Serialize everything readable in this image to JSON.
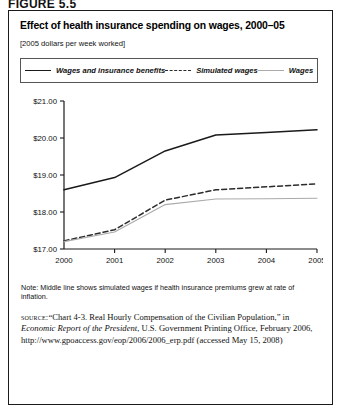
{
  "figure_label": "FIGURE 5.5",
  "chart_data": {
    "type": "line",
    "title": "Effect of health insurance spending on wages, 2000–05",
    "subtitle": "[2005 dollars per week worked]",
    "xlabel": "",
    "ylabel": "",
    "x": [
      2000,
      2001,
      2002,
      2003,
      2004,
      2005
    ],
    "categories": [
      "2000",
      "2001",
      "2002",
      "2003",
      "2004",
      "2005"
    ],
    "xlim": [
      2000,
      2005
    ],
    "ylim": [
      17.0,
      21.0
    ],
    "ytick_labels": [
      "$17.00",
      "$18.00",
      "$19.00",
      "$20.00",
      "$21.00"
    ],
    "ytick_values": [
      17.0,
      18.0,
      19.0,
      20.0,
      21.0
    ],
    "grid": false,
    "legend_position": "top",
    "series": [
      {
        "name": "Wages and insurance benefits",
        "style": "solid",
        "color": "#1a1a1a",
        "values": [
          18.6,
          18.93,
          19.65,
          20.08,
          20.15,
          20.22
        ]
      },
      {
        "name": "Simulated wages",
        "style": "dashed",
        "color": "#2b2b2b",
        "values": [
          17.22,
          17.52,
          18.32,
          18.6,
          18.68,
          18.76
        ]
      },
      {
        "name": "Wages",
        "style": "solid-light",
        "color": "#aaaaaa",
        "values": [
          17.2,
          17.46,
          18.2,
          18.35,
          18.36,
          18.37
        ]
      }
    ],
    "note": "Note: Middle line shows simulated wages if health insurance premiums grew at rate of inflation."
  },
  "source": {
    "label": "source:",
    "text_1": "“Chart 4-3. Real Hourly Compensation of the Civilian Population,” in ",
    "text_italic": "Economic Report of the President",
    "text_2": ", U.S. Government Printing Office, February 2006, http://www.gpoaccess.gov/eop/2006/2006_erp.pdf (accessed May 15, 2008)"
  }
}
